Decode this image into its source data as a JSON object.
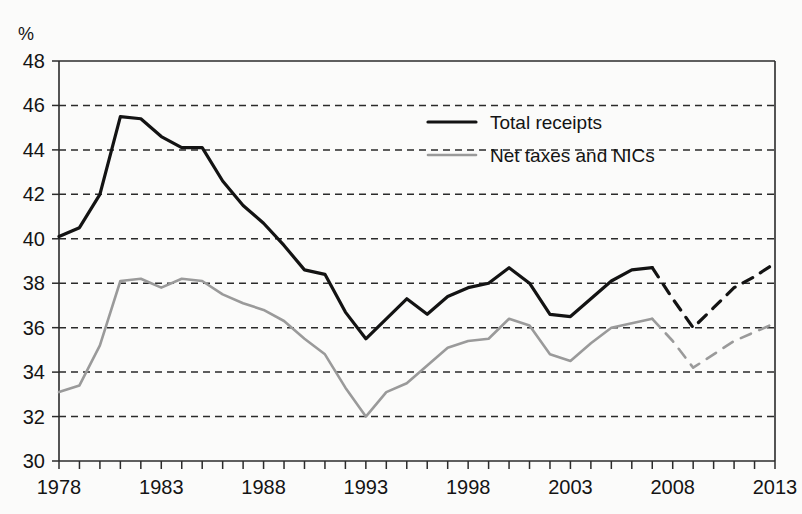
{
  "chart_data": {
    "type": "line",
    "title": "",
    "xlabel": "",
    "ylabel": "",
    "unit_label": "%",
    "ylim": [
      30,
      48
    ],
    "xlim": [
      1978,
      2013
    ],
    "grid": true,
    "legend_position": "top-center",
    "y_ticks": [
      30,
      32,
      34,
      36,
      38,
      40,
      42,
      44,
      46,
      48
    ],
    "x_ticks_labeled": [
      1978,
      1983,
      1988,
      1993,
      1998,
      2003,
      2008,
      2013
    ],
    "x_ticks_all": [
      1978,
      1979,
      1980,
      1981,
      1982,
      1983,
      1984,
      1985,
      1986,
      1987,
      1988,
      1989,
      1990,
      1991,
      1992,
      1993,
      1994,
      1995,
      1996,
      1997,
      1998,
      1999,
      2000,
      2001,
      2002,
      2003,
      2004,
      2005,
      2006,
      2007,
      2008,
      2009,
      2010,
      2011,
      2012,
      2013
    ],
    "forecast_starts": 2007,
    "x": [
      1978,
      1979,
      1980,
      1981,
      1982,
      1983,
      1984,
      1985,
      1986,
      1987,
      1988,
      1989,
      1990,
      1991,
      1992,
      1993,
      1994,
      1995,
      1996,
      1997,
      1998,
      1999,
      2000,
      2001,
      2002,
      2003,
      2004,
      2005,
      2006,
      2007,
      2008,
      2009,
      2010,
      2011,
      2012,
      2013
    ],
    "series": [
      {
        "name": "Total receipts",
        "color": "#131313",
        "width": 3.2,
        "values": [
          40.1,
          40.5,
          42.0,
          45.5,
          45.4,
          44.6,
          44.1,
          44.1,
          42.6,
          41.5,
          40.7,
          39.7,
          38.6,
          38.4,
          36.7,
          35.5,
          36.4,
          37.3,
          36.6,
          37.4,
          37.8,
          38.0,
          38.7,
          38.0,
          36.6,
          36.5,
          37.3,
          38.1,
          38.6,
          38.7,
          37.3,
          36.0,
          36.9,
          37.8,
          38.3,
          38.9
        ]
      },
      {
        "name": "Net taxes and NICs",
        "color": "#9a9a9a",
        "width": 2.6,
        "values": [
          33.1,
          33.4,
          35.2,
          38.1,
          38.2,
          37.8,
          38.2,
          38.1,
          37.5,
          37.1,
          36.8,
          36.3,
          35.5,
          34.8,
          33.3,
          32.0,
          33.1,
          33.5,
          34.3,
          35.1,
          35.4,
          35.5,
          36.4,
          36.1,
          34.8,
          34.5,
          35.3,
          36.0,
          36.2,
          36.4,
          35.4,
          34.2,
          34.8,
          35.4,
          35.8,
          36.2
        ]
      }
    ],
    "legend": [
      {
        "label": "Total receipts",
        "color": "#131313",
        "width": 3.2
      },
      {
        "label": "Net taxes and NICs",
        "color": "#9a9a9a",
        "width": 2.6
      }
    ]
  },
  "geometry": {
    "plot_left": 59,
    "plot_right": 775,
    "plot_top": 61,
    "plot_bottom": 461,
    "legend_x": 428,
    "legend_y_first": 122,
    "legend_row_gap": 33,
    "legend_swatch_width": 48
  }
}
